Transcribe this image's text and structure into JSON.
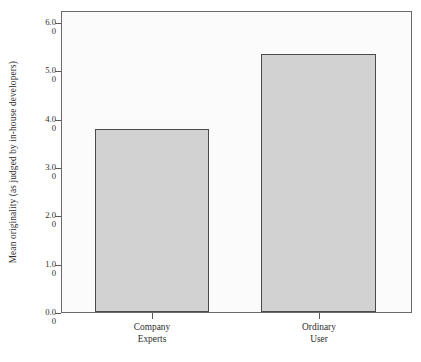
{
  "chart_data": {
    "type": "bar",
    "title": "",
    "xlabel": "",
    "ylabel": "Mean originality (as judged by in-house developers)",
    "ylim": [
      0.0,
      6.0
    ],
    "grid": false,
    "legend": "none",
    "categories": [
      "Company Experts",
      "Ordinary User"
    ],
    "values": [
      3.65,
      5.15
    ],
    "bar_color": "#d2d2d2",
    "bar_edge_color": "#4a4a4a",
    "plot_background": "#fbfbfb",
    "axis_color": "#6a6a6a",
    "ytick_labels": [
      "6.00",
      "5.00",
      "4.00",
      "3.00",
      "2.00",
      "1.00",
      "0.00"
    ],
    "ytick_values": [
      6.0,
      5.0,
      4.0,
      3.0,
      2.0,
      1.0,
      0.0
    ],
    "ytick_label_lines": [
      {
        "l1": "6.0",
        "l2": "0"
      },
      {
        "l1": "5.0",
        "l2": "0"
      },
      {
        "l1": "4.0",
        "l2": "0"
      },
      {
        "l1": "3.0",
        "l2": "0"
      },
      {
        "l1": "2.0",
        "l2": "0"
      },
      {
        "l1": "1.0",
        "l2": "0"
      },
      {
        "l1": "0.0",
        "l2": "0"
      }
    ],
    "xtick_label_lines": [
      {
        "l1": "Company",
        "l2": "Experts"
      },
      {
        "l1": "Ordinary",
        "l2": "User"
      }
    ]
  }
}
